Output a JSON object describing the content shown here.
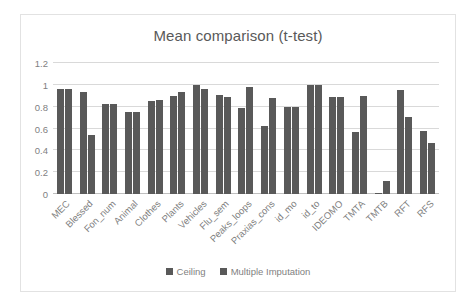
{
  "chart_data": {
    "type": "bar",
    "title": "Mean comparison (t-test)",
    "xlabel": "",
    "ylabel": "",
    "ylim": [
      0,
      1.2
    ],
    "yticks": [
      "0",
      "0.2",
      "0.4",
      "0.6",
      "0.8",
      "1",
      "1.2"
    ],
    "ytick_values": [
      0,
      0.2,
      0.4,
      0.6,
      0.8,
      1,
      1.2
    ],
    "grid": true,
    "legend_position": "bottom",
    "bar_color": "#595959",
    "categories": [
      "MEC",
      "Blessed",
      "Fon_num",
      "Animal",
      "Clothes",
      "Plants",
      "Vehicles",
      "Flu_sem",
      "Peaks_loops",
      "Praxias_cons",
      "id_mo",
      "id_to",
      "IDEOMO",
      "TMTA",
      "TMTB",
      "RFT",
      "RFS"
    ],
    "series": [
      {
        "name": "Ceiling",
        "color": "#595959",
        "values": [
          0.96,
          0.93,
          0.82,
          0.75,
          0.85,
          0.9,
          1.0,
          0.91,
          0.79,
          0.62,
          0.8,
          1.0,
          0.89,
          0.57,
          0.01,
          0.95,
          0.58
        ]
      },
      {
        "name": "Multiple Imputation",
        "color": "#595959",
        "values": [
          0.96,
          0.54,
          0.82,
          0.75,
          0.86,
          0.93,
          0.96,
          0.89,
          0.98,
          0.88,
          0.8,
          1.0,
          0.89,
          0.9,
          0.12,
          0.71,
          0.47
        ]
      }
    ]
  }
}
